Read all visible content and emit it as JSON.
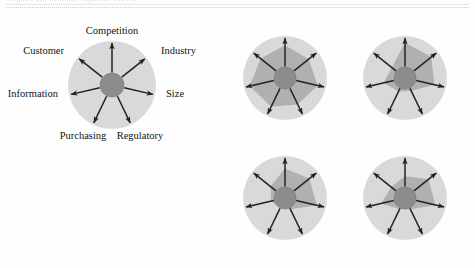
{
  "figure": {
    "caption": "Figure 9.4   Market segment forces",
    "caption_visible": false
  },
  "palette": {
    "page_background": "#fefefe",
    "outer_disc": "#d9d9d9",
    "inner_polygon": "#b0b0b0",
    "hub": "#8c8c8c",
    "hub_stroke": "#7a7a7a",
    "arrow": "#222222",
    "label_text": "#141414",
    "rule": "#c8ccd4"
  },
  "main_wheel": {
    "name": "labelled-forces-wheel",
    "center": {
      "x": 112,
      "y": 85
    },
    "outer_radius": 44,
    "hub_radius": 12,
    "arrow_length": 42,
    "axes": [
      {
        "id": "competition",
        "label": "Competition",
        "angle_deg": 270,
        "label_x": 112,
        "label_y": 26,
        "anchor": "mid"
      },
      {
        "id": "industry",
        "label": "Industry",
        "angle_deg": 321.4,
        "label_x": 161,
        "label_y": 46,
        "anchor": "start"
      },
      {
        "id": "size",
        "label": "Size",
        "angle_deg": 12.9,
        "label_x": 166,
        "label_y": 89,
        "anchor": "start"
      },
      {
        "id": "regulatory",
        "label": "Regulatory",
        "angle_deg": 64.3,
        "label_x": 140,
        "label_y": 131,
        "anchor": "mid"
      },
      {
        "id": "purchasing",
        "label": "Purchasing",
        "angle_deg": 115.7,
        "label_x": 83,
        "label_y": 131,
        "anchor": "mid"
      },
      {
        "id": "information",
        "label": "Information",
        "angle_deg": 167.1,
        "label_x": 58,
        "label_y": 89,
        "anchor": "end"
      },
      {
        "id": "customer",
        "label": "Customer",
        "angle_deg": 218.6,
        "label_x": 64,
        "label_y": 46,
        "anchor": "end"
      }
    ]
  },
  "variant_wheels": [
    {
      "id": "variant-top-left",
      "name": "segment-profile-top-left",
      "center": {
        "x": 285,
        "y": 78
      },
      "outer_radius": 42,
      "hub_radius": 11,
      "arrow_length": 40,
      "profile": [
        0.78,
        0.72,
        0.8,
        0.7,
        0.76,
        0.86,
        0.74
      ]
    },
    {
      "id": "variant-top-right",
      "name": "segment-profile-top-right",
      "center": {
        "x": 405,
        "y": 78
      },
      "outer_radius": 42,
      "hub_radius": 11,
      "arrow_length": 40,
      "profile": [
        0.84,
        0.8,
        0.72,
        0.34,
        0.36,
        0.52,
        0.4
      ]
    },
    {
      "id": "variant-bottom-left",
      "name": "segment-profile-bottom-left",
      "center": {
        "x": 285,
        "y": 198
      },
      "outer_radius": 42,
      "hub_radius": 11,
      "arrow_length": 40,
      "profile": [
        0.7,
        0.74,
        0.78,
        0.3,
        0.26,
        0.34,
        0.44
      ]
    },
    {
      "id": "variant-bottom-right",
      "name": "segment-profile-bottom-right",
      "center": {
        "x": 405,
        "y": 198
      },
      "outer_radius": 42,
      "hub_radius": 11,
      "arrow_length": 40,
      "profile": [
        0.52,
        0.72,
        0.74,
        0.3,
        0.3,
        0.58,
        0.42
      ]
    }
  ]
}
